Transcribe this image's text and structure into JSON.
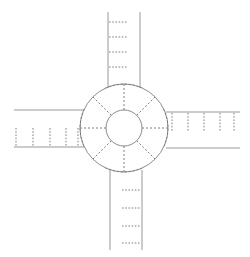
{
  "diagram": {
    "type": "roundabout-junction",
    "canvas": {
      "width": 250,
      "height": 257,
      "background": "#ffffff"
    },
    "colors": {
      "road_edge": "#8d8d91",
      "circle_line": "#7e7e84",
      "dash_marking": "#6f6f75",
      "background": "#ffffff"
    },
    "center": {
      "x": 124,
      "y": 128
    },
    "circles": [
      {
        "name": "outer-ring",
        "radius": 44,
        "style": "solid"
      },
      {
        "name": "inner-island",
        "radius": 18,
        "style": "solid"
      }
    ],
    "spokes": {
      "count": 8,
      "style": "dashed",
      "angles_deg": [
        0,
        45,
        90,
        135,
        180,
        225,
        270,
        315
      ],
      "inner_radius": 18,
      "outer_radius": 44
    },
    "arms": [
      {
        "name": "north-arm",
        "direction": "north",
        "edge_min": 108,
        "edge_max": 140,
        "far_end": 12,
        "near_end": 84,
        "tick_count": 4,
        "tick_side": "left",
        "tick_positions": [
          22,
          37,
          52,
          67
        ]
      },
      {
        "name": "south-arm",
        "direction": "south",
        "edge_min": 110,
        "edge_max": 142,
        "far_end": 250,
        "near_end": 172,
        "tick_count": 4,
        "tick_side": "right",
        "tick_positions": [
          190,
          208,
          226,
          243
        ]
      },
      {
        "name": "west-arm",
        "direction": "west",
        "edge_min": 110,
        "edge_max": 147,
        "far_end": 14,
        "near_end": 80,
        "tick_count": 5,
        "tick_side": "lower",
        "tick_positions": [
          16,
          33,
          50,
          66,
          78
        ]
      },
      {
        "name": "east-arm",
        "direction": "east",
        "edge_min": 112,
        "edge_max": 148,
        "far_end": 240,
        "near_end": 168,
        "tick_count": 5,
        "tick_side": "upper",
        "tick_positions": [
          172,
          188,
          204,
          220,
          234
        ]
      }
    ],
    "give_way_arcs": {
      "style": "dashed",
      "count": 4,
      "description": "dashed arc segments on outer ring at each arm entry"
    }
  }
}
